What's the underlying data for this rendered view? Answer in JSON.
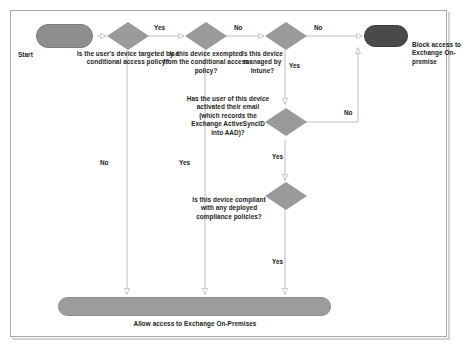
{
  "diagram": {
    "colors": {
      "decision_fill": "#9a9a9a",
      "decision_stroke": "#8a8a8a",
      "terminal_start_fill": "#8e8e8e",
      "terminal_block_fill": "#4a4a4a",
      "terminal_allow_fill": "#9c9c9c",
      "connector": "#b6b6b6",
      "text": "#1b1b1b",
      "frame_border": "#a8a8a8",
      "page_background": "#ffffff"
    },
    "nodes": [
      {
        "id": "start",
        "type": "terminal",
        "label": "Start"
      },
      {
        "id": "targeted",
        "type": "decision",
        "label": "Is the user's device targeted by a conditional access policy?"
      },
      {
        "id": "exempted",
        "type": "decision",
        "label": "Is this device exempted from the conditional access policy?"
      },
      {
        "id": "intune",
        "type": "decision",
        "label": "Is this device managed by Intune?"
      },
      {
        "id": "activesync",
        "type": "decision",
        "label": "Has the user of this device activated their email (which records the Exchange ActiveSyncID into AAD)?"
      },
      {
        "id": "compliant",
        "type": "decision",
        "label": "Is this device compliant with any deployed compliance policies?"
      },
      {
        "id": "block",
        "type": "terminal",
        "label": "Block access to Exchange On-premise"
      },
      {
        "id": "allow",
        "type": "terminal",
        "label": "Allow access to Exchange On-Premises"
      }
    ],
    "edge_labels": {
      "targeted_yes": "Yes",
      "targeted_no": "No",
      "exempted_no": "No",
      "exempted_yes": "Yes",
      "intune_no": "No",
      "intune_yes": "Yes",
      "activesync_no": "No",
      "activesync_yes": "Yes",
      "compliant_yes": "Yes"
    }
  }
}
